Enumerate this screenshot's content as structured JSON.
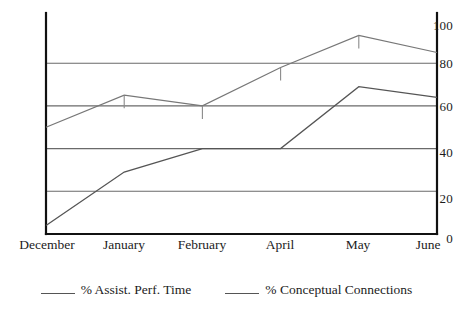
{
  "chart_data": {
    "type": "line",
    "title": "",
    "xlabel": "",
    "ylabel": "",
    "categories": [
      "December",
      "January",
      "February",
      "April",
      "May",
      "June"
    ],
    "ylim": [
      0,
      100
    ],
    "yticks": [
      0,
      20,
      40,
      60,
      80,
      100
    ],
    "grid": true,
    "gridlines_at": [
      20,
      40,
      60,
      80
    ],
    "legend_position": "bottom",
    "series": [
      {
        "name": "% Assist. Perf. Time",
        "color": "#555555",
        "values": [
          4,
          29,
          40,
          40,
          69,
          64
        ]
      },
      {
        "name": "% Conceptual Connections",
        "color": "#777777",
        "values": [
          50,
          65,
          60,
          78,
          93,
          85
        ]
      }
    ],
    "point_markers": {
      "note": "short vertical tick marks drawn downward at selected vertices of the upper series",
      "series": "% Conceptual Connections",
      "at_categories": [
        "January",
        "February",
        "April",
        "May"
      ]
    }
  },
  "axis": {
    "y_tick_labels": [
      "100",
      "80",
      "60",
      "40",
      "20",
      "0"
    ],
    "x_tick_labels": [
      "December",
      "January",
      "February",
      "April",
      "May",
      "June"
    ]
  },
  "legend": {
    "entries": [
      {
        "label": "% Assist. Perf. Time"
      },
      {
        "label": "% Conceptual Connections"
      }
    ]
  },
  "colors": {
    "axis": "#111111",
    "gridline": "#666666",
    "series_lower": "#555555",
    "series_upper": "#7a7a7a",
    "text": "#1c1c1c",
    "background": "#ffffff"
  }
}
